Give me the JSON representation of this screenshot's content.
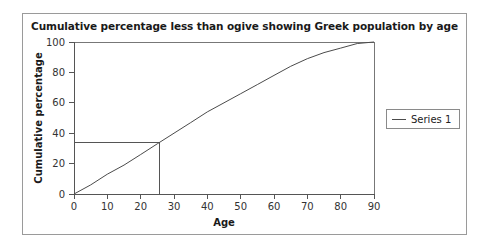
{
  "chart_data": {
    "type": "line",
    "title": "Cumulative percentage less than ogive showing Greek population by age",
    "xlabel": "Age",
    "ylabel": "Cumulative percentage",
    "xlim": [
      0,
      90
    ],
    "ylim": [
      0,
      100
    ],
    "xticks": [
      0,
      10,
      20,
      30,
      40,
      50,
      60,
      70,
      80,
      90
    ],
    "yticks": [
      0,
      20,
      40,
      60,
      80,
      100
    ],
    "grid": false,
    "legend_position": "right",
    "series": [
      {
        "name": "Series 1",
        "x": [
          0,
          5,
          10,
          15,
          20,
          25,
          30,
          35,
          40,
          45,
          50,
          55,
          60,
          65,
          70,
          75,
          80,
          85,
          90
        ],
        "values": [
          0,
          6,
          13,
          19,
          26,
          33,
          40,
          47,
          54,
          60,
          66,
          72,
          78,
          84,
          89,
          93,
          96,
          99,
          100
        ]
      }
    ],
    "annotations": [
      {
        "name": "median-guide",
        "type": "crosshair",
        "x": 25.5,
        "y": 34,
        "description": "Horizontal line from y-axis at 34% meeting vertical line dropping to x-axis at age 25.5"
      }
    ]
  },
  "legend": {
    "entries": [
      {
        "label": "Series 1"
      }
    ]
  }
}
